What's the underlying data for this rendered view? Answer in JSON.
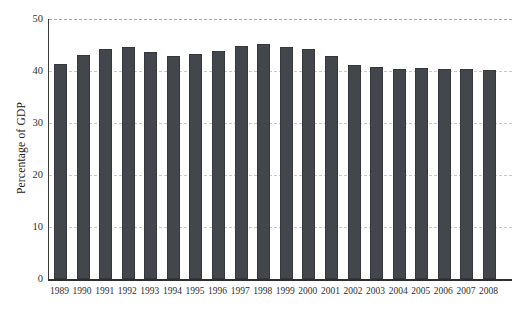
{
  "chart_data": {
    "type": "bar",
    "title": "",
    "xlabel": "",
    "ylabel": "Percentage of GDP",
    "categories": [
      "1989",
      "1990",
      "1991",
      "1992",
      "1993",
      "1994",
      "1995",
      "1996",
      "1997",
      "1998",
      "1999",
      "2000",
      "2001",
      "2002",
      "2003",
      "2004",
      "2005",
      "2006",
      "2007",
      "2008"
    ],
    "values": [
      41.3,
      43.1,
      44.2,
      44.6,
      43.6,
      42.9,
      43.2,
      43.9,
      44.8,
      45.2,
      44.6,
      44.2,
      42.9,
      41.2,
      40.8,
      40.4,
      40.6,
      40.4,
      40.3,
      40.1
    ],
    "ylim": [
      0,
      50
    ],
    "yticks": [
      0,
      10,
      20,
      30,
      40,
      50
    ],
    "grid": "horizontal-dashed",
    "legend": "none",
    "bar_color": "#43464a",
    "bar_edge_color": "#34373b",
    "axis_color": "#2e2e2e",
    "grid_color": "#c9c9c9",
    "top_grid_color": "#a6a6a6",
    "background_color": "#ffffff"
  }
}
